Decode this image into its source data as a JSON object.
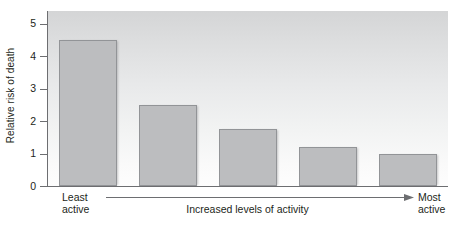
{
  "chart_data": {
    "type": "bar",
    "title": "",
    "xlabel": "Increased levels of activity",
    "ylabel": "Relative risk of death",
    "categories": [
      "Least active",
      "2",
      "3",
      "4",
      "Most active"
    ],
    "values": [
      4.5,
      2.5,
      1.75,
      1.2,
      1.0
    ],
    "ylim": [
      0,
      5.4
    ],
    "yticks": [
      0,
      1,
      2,
      3,
      4,
      5
    ],
    "ytick_labels": [
      "0",
      "1",
      "2",
      "3",
      "4",
      "5"
    ],
    "grid": false,
    "legend": null,
    "annotations": {
      "left_label_line1": "Least",
      "left_label_line2": "active",
      "right_label_line1": "Most",
      "right_label_line2": "active",
      "arrow_caption": "Increased levels of activity",
      "arrow_direction": "right"
    },
    "colors": {
      "bar_fill": "#bcbdbf",
      "bar_border": "#929497",
      "plot_background_top": "#d4d5d6",
      "plot_background_bottom": "#fdfdfd",
      "axis": "#6d6e71",
      "text": "#231f20"
    }
  },
  "axis": {
    "y_title": "Relative risk of death"
  }
}
